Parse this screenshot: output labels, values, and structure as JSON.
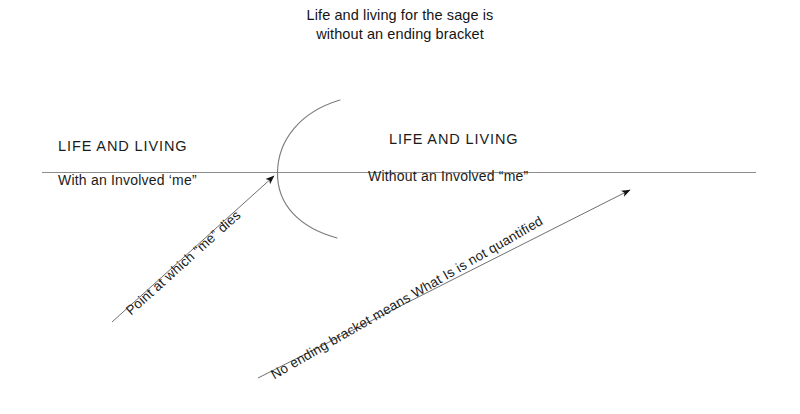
{
  "figure": {
    "title": {
      "line1": "Life and living for the sage is",
      "line2": "without an ending bracket"
    },
    "left_side": {
      "heading": "LIFE AND LIVING",
      "subtitle": "With an Involved ‘me”"
    },
    "right_side": {
      "heading": "LIFE AND LIVING",
      "subtitle": "Without an Involved “me”"
    },
    "annotations": [
      {
        "id": "point-me-dies",
        "text": "Point at which “me” dies",
        "points_to": "opening-bracket-vertex"
      },
      {
        "id": "no-ending-bracket",
        "text": "No ending bracket means What Is is not quantified",
        "points_to": "open-right-end-of-timeline"
      }
    ],
    "shapes": {
      "timeline_name": "horizontal-timeline",
      "bracket_name": "opening-bracket-arc"
    },
    "colors": {
      "background": "#ffffff",
      "ink": "#1b1b1b",
      "line": "#8a8a8a",
      "arc": "#7d7d7d"
    }
  }
}
